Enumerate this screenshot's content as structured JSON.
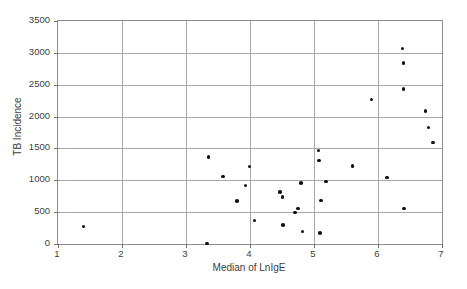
{
  "chart_data": {
    "type": "scatter",
    "title": "",
    "xlabel": "Median of LnIgE",
    "ylabel": "TB Incidence",
    "xlim": [
      1,
      7
    ],
    "ylim": [
      0,
      3500
    ],
    "xticks": [
      1,
      2,
      3,
      4,
      5,
      6,
      7
    ],
    "yticks": [
      0,
      500,
      1000,
      1500,
      2000,
      2500,
      3000,
      3500
    ],
    "xtick_labels": [
      "1",
      "2",
      "3",
      "4",
      "5",
      "6",
      "7"
    ],
    "ytick_labels": [
      "0",
      "500",
      "1000",
      "1500",
      "2000",
      "2500",
      "3000",
      "3500"
    ],
    "grid": {
      "horizontal": true,
      "vertical": true
    },
    "legend": {
      "visible": false,
      "position": "none"
    },
    "series": [
      {
        "name": "countries",
        "marker": "filled-circle",
        "color": "#101010",
        "points": [
          {
            "x": 1.4,
            "y": 275
          },
          {
            "x": 3.33,
            "y": 10
          },
          {
            "x": 3.35,
            "y": 1365
          },
          {
            "x": 3.58,
            "y": 1060
          },
          {
            "x": 3.8,
            "y": 675
          },
          {
            "x": 3.93,
            "y": 920
          },
          {
            "x": 3.99,
            "y": 1215
          },
          {
            "x": 4.07,
            "y": 370
          },
          {
            "x": 4.47,
            "y": 820
          },
          {
            "x": 4.51,
            "y": 735
          },
          {
            "x": 4.52,
            "y": 300
          },
          {
            "x": 4.7,
            "y": 495
          },
          {
            "x": 4.75,
            "y": 555
          },
          {
            "x": 4.8,
            "y": 960
          },
          {
            "x": 4.82,
            "y": 195
          },
          {
            "x": 5.07,
            "y": 1465
          },
          {
            "x": 5.08,
            "y": 1310
          },
          {
            "x": 5.09,
            "y": 170
          },
          {
            "x": 5.11,
            "y": 685
          },
          {
            "x": 5.19,
            "y": 980
          },
          {
            "x": 5.6,
            "y": 1220
          },
          {
            "x": 5.9,
            "y": 2270
          },
          {
            "x": 6.14,
            "y": 1045
          },
          {
            "x": 6.38,
            "y": 3070
          },
          {
            "x": 6.4,
            "y": 2840
          },
          {
            "x": 6.4,
            "y": 2430
          },
          {
            "x": 6.41,
            "y": 560
          },
          {
            "x": 6.74,
            "y": 2090
          },
          {
            "x": 6.79,
            "y": 1830
          },
          {
            "x": 6.86,
            "y": 1590
          }
        ]
      }
    ]
  },
  "colors": {
    "marker": "#101010",
    "grid": "#a8a8a8",
    "frame": "#8d8d8d",
    "text": "#3d3d3d",
    "background": "#ffffff"
  }
}
